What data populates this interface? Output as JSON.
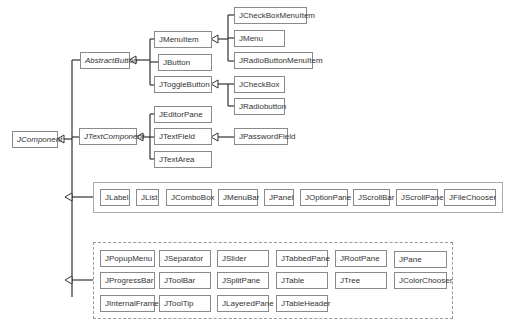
{
  "diagram": {
    "type": "class-hierarchy",
    "root": {
      "label": "JComponent",
      "abstract": true
    },
    "level1": [
      {
        "label": "AbstractButton",
        "abstract": true
      },
      {
        "label": "JTextComponent",
        "abstract": true
      }
    ],
    "abstract_button_children": [
      {
        "label": "JMenuItem"
      },
      {
        "label": "JButton"
      },
      {
        "label": "JToggleButton"
      }
    ],
    "menu_item_children": [
      {
        "label": "JCheckBoxMenuItem"
      },
      {
        "label": "JMenu"
      },
      {
        "label": "JRadioButtonMenuItem"
      }
    ],
    "toggle_button_children": [
      {
        "label": "JCheckBox"
      },
      {
        "label": "JRadiobutton"
      }
    ],
    "text_component_children": [
      {
        "label": "JEditorPane"
      },
      {
        "label": "JTextField"
      },
      {
        "label": "JTextArea"
      }
    ],
    "text_field_children": [
      {
        "label": "JPasswordField"
      }
    ],
    "group1": [
      "JLabel",
      "JList",
      "JComboBox",
      "JMenuBar",
      "JPanel",
      "JOptionPane",
      "JScrollBar",
      "JScrollPane",
      "JFileChooser"
    ],
    "group2": [
      [
        "JPopupMenu",
        "JSeparator",
        "JSlider",
        "JTabbedPane",
        "JRootPane",
        "JPane"
      ],
      [
        "JProgressBar",
        "JToolBar",
        "JSplitPane",
        "JTable",
        "JTree",
        "JColorChooser"
      ],
      [
        "JInternalFrame",
        "JToolTip",
        "JLayeredPane",
        "JTableHeader"
      ]
    ],
    "colors": {
      "line": "#333333",
      "box_border": "#8a8a8a",
      "text": "#333333"
    }
  }
}
